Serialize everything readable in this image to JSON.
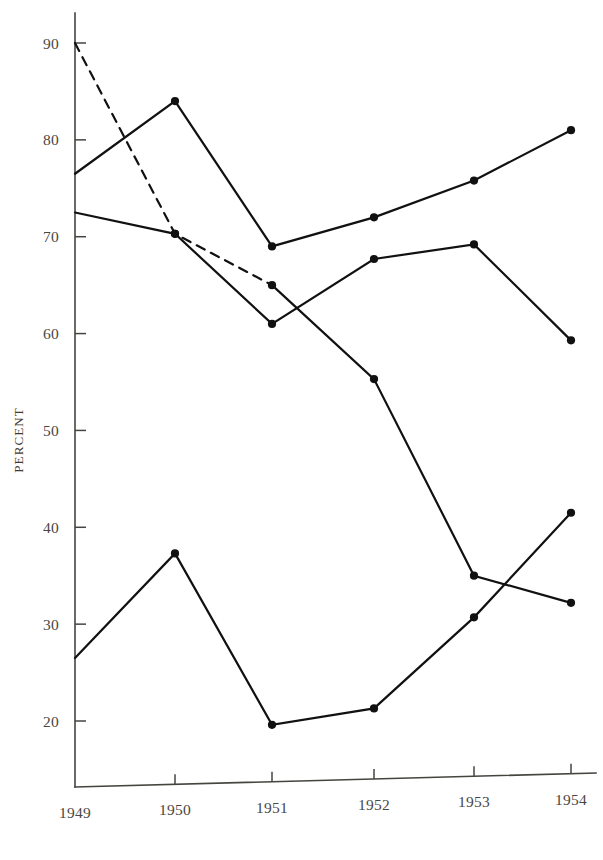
{
  "chart_data": {
    "type": "line",
    "title": "",
    "xlabel": "",
    "ylabel": "PERCENT",
    "x": [
      "1949",
      "1950",
      "1951",
      "1952",
      "1953",
      "1954"
    ],
    "xticklabels": [
      "1949",
      "1950",
      "1951",
      "1952",
      "1953",
      "1954"
    ],
    "yticklabels": [
      "90",
      "80",
      "70",
      "60",
      "50",
      "40",
      "30",
      "20"
    ],
    "yticks": [
      90,
      80,
      70,
      60,
      50,
      40,
      30,
      20
    ],
    "ylim": [
      15,
      93
    ],
    "grid": false,
    "legend": "none",
    "series": [
      {
        "name": "series-a-declining",
        "values": [
          90.0,
          70.3,
          65.0,
          55.3,
          35.0,
          32.2
        ],
        "style": "solid-with-dashed-segment",
        "dashed_segments": [
          [
            0,
            1
          ],
          [
            1,
            2
          ]
        ],
        "markers": [
          false,
          true,
          true,
          true,
          true,
          true
        ],
        "color": "#111111"
      },
      {
        "name": "series-b-rising",
        "values": [
          76.5,
          84.0,
          69.0,
          72.0,
          75.8,
          81.0
        ],
        "style": "solid",
        "markers": [
          false,
          true,
          true,
          true,
          true,
          true
        ],
        "color": "#111111"
      },
      {
        "name": "series-c-middle",
        "values": [
          72.5,
          70.3,
          61.0,
          67.7,
          69.2,
          59.3
        ],
        "style": "solid",
        "markers": [
          false,
          true,
          true,
          true,
          true,
          true
        ],
        "color": "#111111"
      },
      {
        "name": "series-d-lower",
        "values": [
          26.5,
          37.3,
          19.6,
          21.3,
          30.7,
          41.5
        ],
        "style": "solid",
        "markers": [
          false,
          true,
          true,
          true,
          true,
          true
        ],
        "color": "#111111"
      }
    ]
  },
  "axes": {
    "y_axis_label": "PERCENT",
    "y_tick_labels": [
      "90",
      "80",
      "70",
      "60",
      "50",
      "40",
      "30",
      "20"
    ],
    "x_tick_labels": [
      "1949",
      "1950",
      "1951",
      "1952",
      "1953",
      "1954"
    ]
  },
  "colors": {
    "ink": "#111111",
    "axis": "#46443f",
    "text": "#4a4742",
    "background": "#ffffff"
  }
}
